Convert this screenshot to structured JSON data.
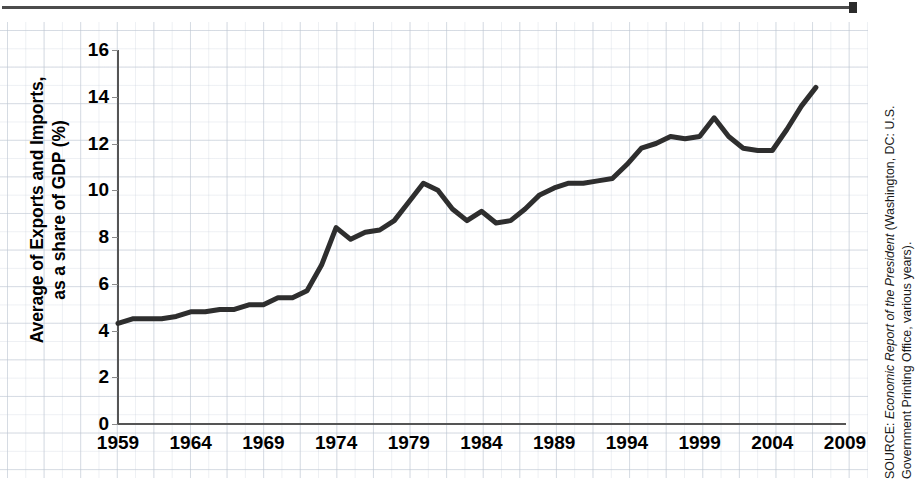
{
  "figure": {
    "top_rule": "horizontal-rule",
    "y_axis_title_line1": "Average of Exports and Imports,",
    "y_axis_title_line2": "as a share of GDP (%)",
    "source_prefix": "SOURCE: ",
    "source_italic": "Economic Report of the President",
    "source_rest": " (Washington, DC: U.S. Government Printing Office, various years)."
  },
  "chart_data": {
    "type": "line",
    "title": "",
    "xlabel": "",
    "ylabel": "Average of Exports and Imports, as a share of GDP (%)",
    "xlim": [
      1959,
      2009
    ],
    "ylim": [
      0,
      16
    ],
    "ytick_labels": [
      "0",
      "2",
      "4",
      "6",
      "8",
      "10",
      "12",
      "14",
      "16"
    ],
    "yticks": [
      0,
      2,
      4,
      6,
      8,
      10,
      12,
      14,
      16
    ],
    "xtick_labels": [
      "1959",
      "1964",
      "1969",
      "1974",
      "1979",
      "1984",
      "1989",
      "1994",
      "1999",
      "2004",
      "2009"
    ],
    "xticks": [
      1959,
      1964,
      1969,
      1974,
      1979,
      1984,
      1989,
      1994,
      1999,
      2004,
      2009
    ],
    "grid": true,
    "legend": "none",
    "line_color": "#2e2e2e",
    "line_width": 5,
    "x": [
      1959,
      1960,
      1961,
      1962,
      1963,
      1964,
      1965,
      1966,
      1967,
      1968,
      1969,
      1970,
      1971,
      1972,
      1973,
      1974,
      1975,
      1976,
      1977,
      1978,
      1979,
      1980,
      1981,
      1982,
      1983,
      1984,
      1985,
      1986,
      1987,
      1988,
      1989,
      1990,
      1991,
      1992,
      1993,
      1994,
      1995,
      1996,
      1997,
      1998,
      1999,
      2000,
      2001,
      2002,
      2003,
      2004,
      2005,
      2006,
      2007
    ],
    "values": [
      4.3,
      4.5,
      4.5,
      4.5,
      4.6,
      4.8,
      4.8,
      4.9,
      4.9,
      5.1,
      5.1,
      5.4,
      5.4,
      5.7,
      6.8,
      8.4,
      7.9,
      8.2,
      8.3,
      8.7,
      9.5,
      10.3,
      10.0,
      9.2,
      8.7,
      9.1,
      8.6,
      8.7,
      9.2,
      9.8,
      10.1,
      10.3,
      10.3,
      10.4,
      10.5,
      11.1,
      11.8,
      12.0,
      12.3,
      12.2,
      12.3,
      13.1,
      12.3,
      11.8,
      11.7,
      11.7,
      12.6,
      13.6,
      14.4
    ],
    "annotations": []
  }
}
